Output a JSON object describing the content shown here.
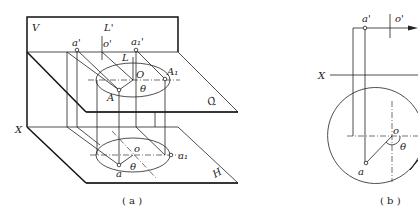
{
  "figure_a": {
    "caption": "( a )",
    "labels": {
      "V": "V",
      "L_prime": "L'",
      "a_prime": "a'",
      "o_prime": "o'",
      "a1_prime": "a₁'",
      "L": "L",
      "O": "O",
      "A1": "A₁",
      "theta_upper": "θ",
      "A": "A",
      "Q": "Q",
      "X": "X",
      "o": "o",
      "a1": "a₁",
      "theta_lower": "θ",
      "a": "a",
      "H": "H"
    }
  },
  "figure_b": {
    "caption": "( b )",
    "labels": {
      "a_prime": "a'",
      "o_prime": "o'",
      "X": "X",
      "o": "o",
      "theta": "θ",
      "a": "a"
    }
  }
}
